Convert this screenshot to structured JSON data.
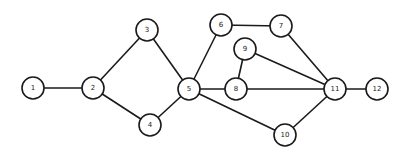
{
  "diagram": {
    "type": "undirected-graph",
    "node_radius": 11,
    "colors": {
      "stroke": "#1a1a1a",
      "fill": "#ffffff",
      "background": "#ffffff"
    },
    "nodes": [
      {
        "id": "1",
        "label": "1",
        "x": 33,
        "y": 88
      },
      {
        "id": "2",
        "label": "2",
        "x": 93,
        "y": 88
      },
      {
        "id": "3",
        "label": "3",
        "x": 147,
        "y": 30
      },
      {
        "id": "4",
        "label": "4",
        "x": 150,
        "y": 125
      },
      {
        "id": "5",
        "label": "5",
        "x": 189,
        "y": 89
      },
      {
        "id": "6",
        "label": "6",
        "x": 221,
        "y": 25
      },
      {
        "id": "7",
        "label": "7",
        "x": 281,
        "y": 26
      },
      {
        "id": "8",
        "label": "8",
        "x": 236,
        "y": 89
      },
      {
        "id": "9",
        "label": "9",
        "x": 245,
        "y": 49
      },
      {
        "id": "10",
        "label": "10",
        "x": 285,
        "y": 135
      },
      {
        "id": "11",
        "label": "11",
        "x": 335,
        "y": 89
      },
      {
        "id": "12",
        "label": "12",
        "x": 377,
        "y": 89
      }
    ],
    "edges": [
      [
        "1",
        "2"
      ],
      [
        "2",
        "3"
      ],
      [
        "2",
        "4"
      ],
      [
        "3",
        "5"
      ],
      [
        "4",
        "5"
      ],
      [
        "5",
        "6"
      ],
      [
        "5",
        "8"
      ],
      [
        "5",
        "10"
      ],
      [
        "6",
        "7"
      ],
      [
        "7",
        "11"
      ],
      [
        "9",
        "8"
      ],
      [
        "9",
        "11"
      ],
      [
        "8",
        "11"
      ],
      [
        "10",
        "11"
      ],
      [
        "11",
        "12"
      ]
    ]
  }
}
